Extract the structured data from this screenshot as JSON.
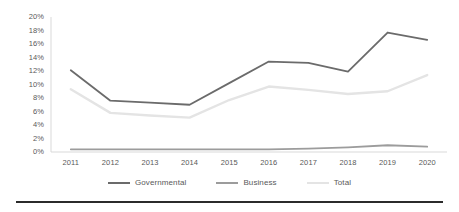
{
  "chart_data": {
    "type": "line",
    "title": "",
    "subtitle": "",
    "xlabel": "",
    "ylabel": "",
    "categories": [
      "2011",
      "2012",
      "2013",
      "2014",
      "2015",
      "2016",
      "2017",
      "2018",
      "2019",
      "2020"
    ],
    "ylim": [
      0,
      20
    ],
    "ytick_labels": [
      "0%",
      "2%",
      "4%",
      "6%",
      "8%",
      "10%",
      "12%",
      "14%",
      "16%",
      "18%",
      "20%"
    ],
    "ytick_values": [
      0,
      2,
      4,
      6,
      8,
      10,
      12,
      14,
      16,
      18,
      20
    ],
    "grid": false,
    "legend_position": "bottom",
    "series": [
      {
        "name": "Governmental",
        "color": "#6b6b6b",
        "values": [
          12.1,
          7.6,
          7.3,
          7.0,
          10.2,
          13.4,
          13.2,
          11.9,
          17.7,
          16.6
        ]
      },
      {
        "name": "Business",
        "color": "#9c9c9c",
        "values": [
          0.4,
          0.4,
          0.4,
          0.4,
          0.4,
          0.4,
          0.5,
          0.7,
          1.0,
          0.8
        ]
      },
      {
        "name": "Total",
        "color": "#e4e4e4",
        "values": [
          9.3,
          5.8,
          5.4,
          5.1,
          7.7,
          9.7,
          9.2,
          8.6,
          9.0,
          11.4
        ]
      }
    ]
  },
  "legend": {
    "items": [
      {
        "label": "Governmental",
        "color": "#6b6b6b"
      },
      {
        "label": "Business",
        "color": "#9c9c9c"
      },
      {
        "label": "Total",
        "color": "#e4e4e4"
      }
    ]
  },
  "axes": {
    "y_axis_color": "#d9d9d9",
    "x_axis_color": "#d9d9d9",
    "tick_text_color": "#595959"
  }
}
